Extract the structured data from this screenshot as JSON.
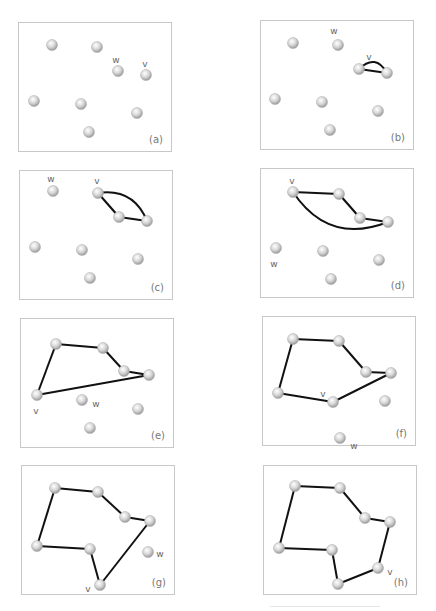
{
  "figure": {
    "node_color": "#d4d4d4",
    "edge_color": "#111111",
    "label_color": "#666666",
    "nodes": [
      [
        33,
        22
      ],
      [
        78,
        24
      ],
      [
        99,
        48
      ],
      [
        127,
        52
      ],
      [
        15,
        78
      ],
      [
        62,
        81
      ],
      [
        118,
        90
      ],
      [
        70,
        109
      ]
    ],
    "panels": [
      {
        "id": "a",
        "label": "(a)",
        "left": 18,
        "top": 22,
        "edges": [],
        "curves": [],
        "labels": [
          {
            "text": "w",
            "node": 2,
            "dx": -2,
            "dy": -11
          },
          {
            "text": "v",
            "node": 3,
            "dx": -1,
            "dy": -11
          }
        ]
      },
      {
        "id": "b",
        "label": "(b)",
        "left": 260,
        "top": 20,
        "edges": [
          [
            2,
            3
          ]
        ],
        "curves": [
          [
            2,
            3,
            -18
          ]
        ],
        "labels": [
          {
            "text": "w",
            "node": 1,
            "dx": -4,
            "dy": -14
          },
          {
            "text": "v",
            "node": 2,
            "dx": 10,
            "dy": -12
          }
        ]
      },
      {
        "id": "c",
        "label": "(c)",
        "left": 19,
        "top": 170,
        "edges": [
          [
            1,
            2
          ],
          [
            2,
            3
          ]
        ],
        "curves": [
          [
            1,
            3,
            -22
          ]
        ],
        "labels": [
          {
            "text": "w",
            "node": 0,
            "dx": -2,
            "dy": -12
          },
          {
            "text": "v",
            "node": 1,
            "dx": -1,
            "dy": -12
          }
        ]
      },
      {
        "id": "d",
        "label": "(d)",
        "left": 260,
        "top": 168,
        "edges": [
          [
            0,
            1
          ],
          [
            1,
            2
          ],
          [
            2,
            3
          ]
        ],
        "curves": [
          [
            0,
            3,
            40
          ]
        ],
        "labels": [
          {
            "text": "v",
            "node": 0,
            "dx": -1,
            "dy": -11
          },
          {
            "text": "w",
            "node": 4,
            "dx": -2,
            "dy": 16
          }
        ]
      },
      {
        "id": "e",
        "label": "(e)",
        "left": 20,
        "top": 318,
        "edges": [
          [
            0,
            1
          ],
          [
            1,
            2
          ],
          [
            2,
            3
          ],
          [
            4,
            0
          ],
          [
            4,
            3
          ]
        ],
        "curves": [],
        "labels": [
          {
            "text": "v",
            "node": 4,
            "dx": -1,
            "dy": 16
          },
          {
            "text": "w",
            "node": 5,
            "dx": 14,
            "dy": 4
          }
        ]
      },
      {
        "id": "f",
        "label": "(f)",
        "left": 262,
        "top": 316,
        "edges": [
          [
            4,
            0
          ],
          [
            0,
            1
          ],
          [
            1,
            2
          ],
          [
            2,
            3
          ],
          [
            3,
            5
          ],
          [
            5,
            4
          ]
        ],
        "curves": [],
        "labels": [
          {
            "text": "v",
            "node": 5,
            "dx": -10,
            "dy": -8
          },
          {
            "text": "w",
            "node": 7,
            "dx": 14,
            "dy": 8
          }
        ]
      },
      {
        "id": "g",
        "label": "(g)",
        "left": 21,
        "top": 465,
        "edges": [
          [
            4,
            0
          ],
          [
            0,
            1
          ],
          [
            1,
            2
          ],
          [
            2,
            3
          ],
          [
            3,
            7
          ],
          [
            4,
            5
          ],
          [
            5,
            7
          ]
        ],
        "curves": [],
        "labels": [
          {
            "text": "v",
            "node": 7,
            "dx": -12,
            "dy": 4
          },
          {
            "text": "w",
            "node": 6,
            "dx": 12,
            "dy": 2
          }
        ]
      },
      {
        "id": "h",
        "label": "(h)",
        "left": 263,
        "top": 465,
        "edges": [
          [
            4,
            0
          ],
          [
            0,
            1
          ],
          [
            1,
            2
          ],
          [
            2,
            3
          ],
          [
            3,
            6
          ],
          [
            6,
            7
          ],
          [
            7,
            5
          ],
          [
            5,
            4
          ]
        ],
        "curves": [],
        "labels": [
          {
            "text": "v",
            "node": 6,
            "dx": 12,
            "dy": 4
          }
        ]
      }
    ]
  }
}
